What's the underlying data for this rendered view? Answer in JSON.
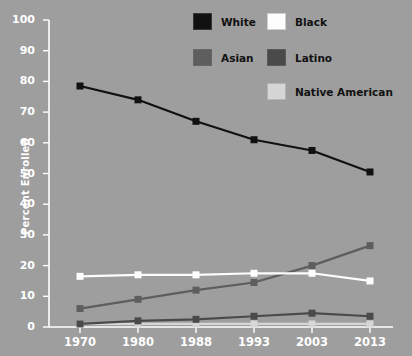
{
  "chart_data": {
    "type": "line",
    "title": "",
    "xlabel": "",
    "ylabel": "Percent Enrolled",
    "categories": [
      "1970",
      "1980",
      "1988",
      "1993",
      "2003",
      "2013"
    ],
    "ylim": [
      0,
      100
    ],
    "yticks": [
      0,
      10,
      20,
      30,
      40,
      50,
      60,
      70,
      80,
      90,
      100
    ],
    "grid": false,
    "legend_position": "top-right",
    "series": [
      {
        "name": "White",
        "color": "#111111",
        "values": [
          78.5,
          74,
          67,
          61,
          57.5,
          50.5
        ]
      },
      {
        "name": "Black",
        "color": "#fdfdfd",
        "values": [
          16.5,
          17,
          17,
          17.5,
          17.5,
          15
        ]
      },
      {
        "name": "Asian",
        "color": "#5e5e5e",
        "values": [
          6,
          9,
          12,
          14.5,
          20,
          26.5
        ]
      },
      {
        "name": "Latino",
        "color": "#4a4a4a",
        "values": [
          1,
          2,
          2.5,
          3.5,
          4.5,
          3.5
        ]
      },
      {
        "name": "Native American",
        "color": "#d6d6d6",
        "values": [
          1,
          1,
          1,
          1,
          1,
          1
        ]
      }
    ]
  },
  "axes": {
    "y_axis_title": "Percent Enrolled",
    "y_tick_labels": [
      "100",
      "90",
      "80",
      "70",
      "60",
      "50",
      "40",
      "30",
      "20",
      "10",
      "0"
    ],
    "x_tick_labels": [
      "1970",
      "1980",
      "1988",
      "1993",
      "2003",
      "2013"
    ]
  },
  "legend": {
    "entries": [
      {
        "label": "White",
        "color": "#111111"
      },
      {
        "label": "Black",
        "color": "#fdfdfd"
      },
      {
        "label": "Asian",
        "color": "#5e5e5e"
      },
      {
        "label": "Latino",
        "color": "#4a4a4a"
      },
      {
        "label": "Native American",
        "color": "#d6d6d6"
      }
    ]
  },
  "colors": {
    "background": "#9e9e9e",
    "axis": "#ffffff",
    "tick_text": "#ffffff",
    "legend_text": "#111111"
  }
}
